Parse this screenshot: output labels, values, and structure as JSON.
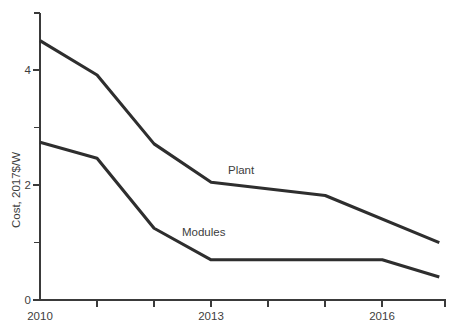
{
  "chart_data": {
    "type": "line",
    "title": "",
    "subtitle": "",
    "xlabel": "",
    "ylabel": "Cost, 2017$/W",
    "xlim": [
      2010,
      2017.1
    ],
    "ylim": [
      0,
      5
    ],
    "grid": false,
    "legend_position": "inline-annotation",
    "x_ticks_major": [
      2010,
      2013,
      2016
    ],
    "x_tick_labels": [
      "2010",
      "2013",
      "2016"
    ],
    "x_ticks_minor": [
      2011,
      2012,
      2014,
      2015,
      2017
    ],
    "y_ticks_major": [
      0,
      2,
      4
    ],
    "y_tick_labels": [
      "0",
      "2",
      "4"
    ],
    "y_ticks_minor": [
      1,
      3,
      5
    ],
    "series": [
      {
        "name": "Plant",
        "label": "Plant",
        "color": "#2e2e2e",
        "x": [
          2010,
          2011,
          2012,
          2013,
          2015,
          2017
        ],
        "values": [
          4.52,
          3.92,
          2.72,
          2.05,
          1.82,
          1.0
        ]
      },
      {
        "name": "Modules",
        "label": "Modules",
        "color": "#2e2e2e",
        "x": [
          2010,
          2011,
          2012,
          2013,
          2016,
          2017
        ],
        "values": [
          2.75,
          2.47,
          1.25,
          0.7,
          0.7,
          0.4
        ]
      }
    ],
    "annotations": [
      {
        "text": "Plant",
        "x": 2014.05,
        "y": 2.38
      },
      {
        "text": "Modules",
        "x": 2012.6,
        "y": 1.32
      }
    ]
  },
  "axis": {
    "y_title": "Cost, 2017$/W",
    "y_labels": [
      "4",
      "2",
      "0"
    ],
    "x_labels": [
      "2010",
      "2013",
      "2016"
    ]
  },
  "labels": {
    "plant": "Plant",
    "modules": "Modules"
  },
  "colors": {
    "line": "#2e2e2e",
    "axis": "#3a3a3a",
    "text": "#3d3d3d",
    "background": "#ffffff"
  }
}
